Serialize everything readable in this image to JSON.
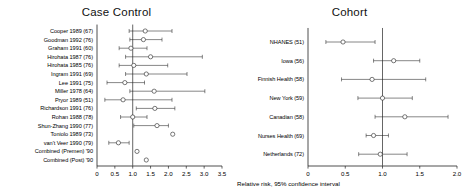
{
  "figure": {
    "axis_caption": "Relative risk, 95% confidence interval",
    "marker_shape": "open-circle",
    "line_color": "#222222",
    "reference_line_value": 1.0
  },
  "chart_data": [
    {
      "type": "forest",
      "panel_id": "case-control",
      "title": "Case Control",
      "xlabel": "",
      "ylabel": "",
      "xlim": [
        0,
        3.5
      ],
      "xticks": [
        0,
        0.5,
        1.0,
        1.5,
        2.0,
        2.5,
        3.0,
        3.5
      ],
      "xticklabels": [
        "0",
        "0.5",
        "1.0",
        "1.5",
        "2.0",
        "2.5",
        "3.0",
        "3.5"
      ],
      "reference_line": 1.0,
      "grid": false,
      "legend": "none",
      "categories": [
        "Cooper 1989 (67)",
        "Goodman 1992 (76)",
        "Graham 1991 (60)",
        "Hirohata 1987 (76)",
        "Hirohata 1985 (76)",
        "Ingram 1991 (69)",
        "Lee 1991 (75)",
        "Miller 1978 (64)",
        "Pryor 1989 (51)",
        "Richardson 1991 (76)",
        "Rohan 1988 (78)",
        "Shun-Zhang 1990 (77)",
        "Toniolo 1989 (73)",
        "van't Veer 1990 (79)",
        "Combined (Premen) '90",
        "Combined (Post) '90"
      ],
      "points": [
        {
          "label": "Cooper 1989 (67)",
          "estimate": 1.35,
          "ci_low": 0.9,
          "ci_high": 2.1
        },
        {
          "label": "Goodman 1992 (76)",
          "estimate": 1.3,
          "ci_low": 0.92,
          "ci_high": 1.82
        },
        {
          "label": "Graham 1991 (60)",
          "estimate": 0.95,
          "ci_low": 0.62,
          "ci_high": 1.4
        },
        {
          "label": "Hirohata 1987 (76)",
          "estimate": 1.5,
          "ci_low": 0.8,
          "ci_high": 2.95
        },
        {
          "label": "Hirohata 1985 (76)",
          "estimate": 1.03,
          "ci_low": 0.62,
          "ci_high": 1.98
        },
        {
          "label": "Ingram 1991 (69)",
          "estimate": 1.38,
          "ci_low": 0.8,
          "ci_high": 2.52
        },
        {
          "label": "Lee 1991 (75)",
          "estimate": 0.78,
          "ci_low": 0.28,
          "ci_high": 1.33
        },
        {
          "label": "Miller 1978 (64)",
          "estimate": 1.6,
          "ci_low": 0.92,
          "ci_high": 3.02
        },
        {
          "label": "Pryor 1989 (51)",
          "estimate": 0.73,
          "ci_low": 0.22,
          "ci_high": 2.1
        },
        {
          "label": "Richardson 1991 (76)",
          "estimate": 1.62,
          "ci_low": 1.1,
          "ci_high": 2.18
        },
        {
          "label": "Rohan 1988 (78)",
          "estimate": 1.0,
          "ci_low": 0.66,
          "ci_high": 1.4
        },
        {
          "label": "Shun-Zhang 1990 (77)",
          "estimate": 1.68,
          "ci_low": 1.03,
          "ci_high": 2.0
        },
        {
          "label": "Toniolo 1989 (73)",
          "estimate": 2.12,
          "ci_low": null,
          "ci_high": null
        },
        {
          "label": "van't Veer 1990 (79)",
          "estimate": 0.6,
          "ci_low": 0.33,
          "ci_high": 0.9
        },
        {
          "label": "Combined (Premen) '90",
          "estimate": 1.12,
          "ci_low": null,
          "ci_high": null
        },
        {
          "label": "Combined (Post) '90",
          "estimate": 1.38,
          "ci_low": null,
          "ci_high": null
        }
      ]
    },
    {
      "type": "forest",
      "panel_id": "cohort",
      "title": "Cohort",
      "xlabel": "Relative risk, 95% confidence interval",
      "ylabel": "",
      "xlim": [
        0,
        2.0
      ],
      "xticks": [
        0,
        0.5,
        1.0,
        1.5,
        2.0
      ],
      "xticklabels": [
        "0",
        "0.5",
        "1.0",
        "1.5",
        "2.0"
      ],
      "reference_line": 1.0,
      "grid": false,
      "legend": "none",
      "categories": [
        "NHANES (51)",
        "Iowa (56)",
        "Finnish Health (58)",
        "New York (59)",
        "Canadian (58)",
        "Nurses Health (69)",
        "Netherlands (72)"
      ],
      "points": [
        {
          "label": "NHANES (51)",
          "estimate": 0.47,
          "ci_low": 0.24,
          "ci_high": 0.9
        },
        {
          "label": "Iowa (56)",
          "estimate": 1.15,
          "ci_low": 0.88,
          "ci_high": 1.5
        },
        {
          "label": "Finnish Health (58)",
          "estimate": 0.86,
          "ci_low": 0.45,
          "ci_high": 1.58
        },
        {
          "label": "New York (59)",
          "estimate": 1.0,
          "ci_low": 0.67,
          "ci_high": 1.4
        },
        {
          "label": "Canadian (58)",
          "estimate": 1.3,
          "ci_low": 0.9,
          "ci_high": 1.88
        },
        {
          "label": "Nurses Health (69)",
          "estimate": 0.88,
          "ci_low": 0.78,
          "ci_high": 1.08
        },
        {
          "label": "Netherlands (72)",
          "estimate": 0.97,
          "ci_low": 0.68,
          "ci_high": 1.33
        }
      ]
    }
  ]
}
